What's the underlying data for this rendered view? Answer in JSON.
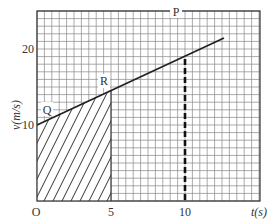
{
  "chart_data": {
    "type": "line",
    "title": "",
    "xlabel": "t(s)",
    "ylabel": "v(m/s)",
    "xlim": [
      0,
      15
    ],
    "ylim": [
      0,
      25
    ],
    "grid": true,
    "grid_minor_step": {
      "x": 0.5,
      "y": 1
    },
    "x_ticks": [
      "0",
      "5",
      "10"
    ],
    "y_ticks": [
      "10",
      "20"
    ],
    "origin_label": "O",
    "series": [
      {
        "name": "velocity",
        "x": [
          0,
          12.6
        ],
        "y": [
          10,
          21.4
        ],
        "style": "solid"
      }
    ],
    "points": [
      {
        "label": "Q",
        "x": 1.5,
        "y": 11.3
      },
      {
        "label": "R",
        "x": 5,
        "y": 14.5
      },
      {
        "label": "P",
        "x": 10,
        "y": 19
      }
    ],
    "annotations": [
      {
        "type": "shaded_area",
        "description": "hatched region under line from t=0 to t=5"
      },
      {
        "type": "dashed_vertical",
        "x": 10,
        "from_y": 0,
        "to_y": 19
      }
    ]
  },
  "labels": {
    "origin": "O",
    "x_tick_5": "5",
    "x_tick_10": "10",
    "y_tick_10": "10",
    "y_tick_20": "20",
    "x_axis": "t(s)",
    "y_axis": "v(m/s)",
    "point_q": "Q",
    "point_r": "R",
    "point_p": "P"
  }
}
